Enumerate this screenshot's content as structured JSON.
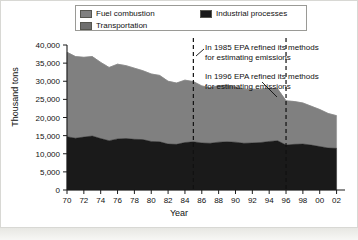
{
  "legend": {
    "entries": [
      {
        "label": "Fuel combustion",
        "color": "#808080",
        "icon": "legend-swatch-icon"
      },
      {
        "label": "Industrial processes",
        "color": "#1a1a1a",
        "icon": "legend-swatch-icon"
      },
      {
        "label": "Transportation",
        "color": "#6e6e6e",
        "icon": "legend-swatch-icon"
      }
    ]
  },
  "axes": {
    "ylabel": "Thousand tons",
    "xlabel": "Year"
  },
  "annotations": {
    "a1985": {
      "line1": "In 1985 EPA refined its methods",
      "line2": "for estimating emissions",
      "year": 1985
    },
    "a1996": {
      "line1": "In 1996 EPA refined its methods",
      "line2": "for estimating emissions",
      "year": 1996
    }
  },
  "chart_data": {
    "type": "area",
    "title": "",
    "subtitle": "",
    "xlabel": "Year",
    "ylabel": "Thousand tons",
    "stacked": true,
    "grid": false,
    "legend_position": "top",
    "xlim": [
      1970,
      2003
    ],
    "ylim": [
      0,
      40000
    ],
    "ytick_labels": [
      "0",
      "5,000",
      "10,000",
      "15,000",
      "20,000",
      "25,000",
      "30,000",
      "35,000",
      "40,000"
    ],
    "ytick_values": [
      0,
      5000,
      10000,
      15000,
      20000,
      25000,
      30000,
      35000,
      40000
    ],
    "xtick_labels": [
      "70",
      "72",
      "74",
      "76",
      "78",
      "80",
      "82",
      "84",
      "86",
      "88",
      "90",
      "92",
      "94",
      "96",
      "98",
      "00",
      "02"
    ],
    "xtick_values": [
      1970,
      1972,
      1974,
      1976,
      1978,
      1980,
      1982,
      1984,
      1986,
      1988,
      1990,
      1992,
      1994,
      1996,
      1998,
      2000,
      2002
    ],
    "x": [
      1970,
      1971,
      1972,
      1973,
      1974,
      1975,
      1976,
      1977,
      1978,
      1979,
      1980,
      1981,
      1982,
      1983,
      1984,
      1985,
      1986,
      1987,
      1988,
      1989,
      1990,
      1991,
      1992,
      1993,
      1994,
      1995,
      1996,
      1997,
      1998,
      1999,
      2000,
      2001,
      2002
    ],
    "series": [
      {
        "name": "Industrial processes",
        "color": "#1a1a1a",
        "order": 1,
        "values": [
          14700,
          14300,
          14600,
          14900,
          14200,
          13600,
          14100,
          14200,
          14000,
          13900,
          13400,
          13300,
          12700,
          12600,
          13100,
          13300,
          13000,
          12900,
          13200,
          13300,
          13200,
          12900,
          13000,
          13100,
          13400,
          13600,
          12400,
          12600,
          12700,
          12400,
          12000,
          11600,
          11500
        ]
      },
      {
        "name": "Fuel combustion",
        "color": "#808080",
        "order": 2,
        "values": [
          23300,
          22500,
          22000,
          21900,
          21000,
          20200,
          20600,
          20100,
          19600,
          19000,
          18600,
          18300,
          17300,
          16900,
          17200,
          16600,
          15700,
          15300,
          15600,
          15600,
          15200,
          14900,
          14800,
          14700,
          14700,
          14300,
          12200,
          11800,
          11300,
          10700,
          10200,
          9500,
          9000
        ]
      },
      {
        "name": "Transportation",
        "color": "#6e6e6e",
        "order": 3,
        "values": [
          0,
          0,
          0,
          0,
          0,
          0,
          0,
          0,
          0,
          0,
          0,
          0,
          0,
          0,
          0,
          0,
          0,
          0,
          0,
          0,
          0,
          0,
          0,
          0,
          0,
          0,
          0,
          0,
          0,
          0,
          0,
          0,
          0
        ]
      }
    ],
    "totals": [
      38000,
      36800,
      36600,
      36800,
      35200,
      33800,
      34700,
      34300,
      33600,
      32900,
      32000,
      31600,
      30000,
      29500,
      30300,
      29900,
      28700,
      28200,
      28800,
      28900,
      28400,
      27800,
      27800,
      27800,
      28100,
      27900,
      24600,
      24400,
      24000,
      23100,
      22200,
      21100,
      20500
    ],
    "annotations": [
      {
        "x": 1985,
        "text": "In 1985 EPA refined its methods for estimating emissions"
      },
      {
        "x": 1996,
        "text": "In 1996 EPA refined its methods for estimating emissions"
      }
    ]
  }
}
